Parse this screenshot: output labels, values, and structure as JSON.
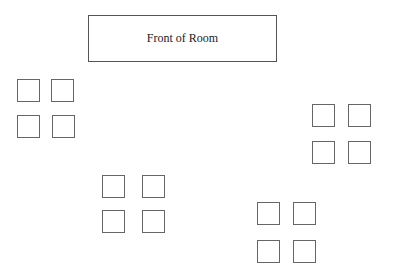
{
  "diagram": {
    "title": "Front of Room",
    "front_box": {
      "x": 88,
      "y": 15,
      "w": 189,
      "h": 47
    },
    "groups": [
      {
        "name": "group-top-left",
        "desks": [
          [
            17,
            79
          ],
          [
            51,
            79
          ],
          [
            17,
            115
          ],
          [
            52,
            115
          ]
        ]
      },
      {
        "name": "group-right",
        "desks": [
          [
            312,
            104
          ],
          [
            348,
            104
          ],
          [
            312,
            141
          ],
          [
            348,
            141
          ]
        ]
      },
      {
        "name": "group-middle",
        "desks": [
          [
            102,
            175
          ],
          [
            142,
            175
          ],
          [
            102,
            210
          ],
          [
            142,
            210
          ]
        ]
      },
      {
        "name": "group-bottom-right",
        "desks": [
          [
            257,
            202
          ],
          [
            293,
            202
          ],
          [
            257,
            240
          ],
          [
            293,
            240
          ]
        ]
      }
    ],
    "desk_size": 23,
    "stroke_color": "#666666"
  }
}
